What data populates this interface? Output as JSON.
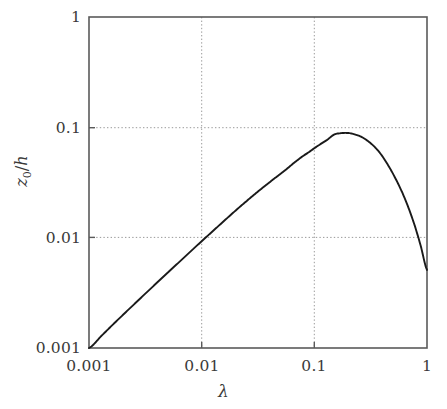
{
  "chart_data": {
    "type": "line",
    "title": "",
    "subtitle": "",
    "xlabel": "λ",
    "ylabel": "z₀/h",
    "ylabel_parts": {
      "main": "z",
      "subscript": "0",
      "slash": "/",
      "denominator": "h"
    },
    "xscale": "log",
    "yscale": "log",
    "xlim": [
      0.001,
      1
    ],
    "ylim": [
      0.001,
      1
    ],
    "grid": true,
    "grid_style": "dotted",
    "grid_color": "#9a9a9a",
    "legend": null,
    "legend_position": "none",
    "axis_color": "#555555",
    "line_color": "#1a1a1a",
    "line_width": 1.9,
    "background_color": "#ffffff",
    "xticks": [
      0.001,
      0.01,
      0.1,
      1
    ],
    "xtick_labels": [
      "0.001",
      "0.01",
      "0.1",
      "1"
    ],
    "yticks": [
      0.001,
      0.01,
      0.1,
      1
    ],
    "ytick_labels": [
      "0.001",
      "0.01",
      "0.1",
      "1"
    ],
    "series": [
      {
        "name": "z0/h vs lambda",
        "x": [
          0.001,
          0.0013,
          0.0017,
          0.0022,
          0.0029,
          0.0038,
          0.005,
          0.0065,
          0.0085,
          0.011,
          0.0145,
          0.019,
          0.025,
          0.032,
          0.042,
          0.055,
          0.072,
          0.09,
          0.11,
          0.13,
          0.15,
          0.17,
          0.19,
          0.21,
          0.24,
          0.27,
          0.31,
          0.35,
          0.4,
          0.46,
          0.52,
          0.6,
          0.68,
          0.78,
          0.88,
          1.0
        ],
        "y": [
          0.001,
          0.0013,
          0.0017,
          0.00219,
          0.00286,
          0.00371,
          0.00482,
          0.00618,
          0.00797,
          0.01015,
          0.0131,
          0.0168,
          0.0214,
          0.0265,
          0.033,
          0.0408,
          0.051,
          0.0598,
          0.069,
          0.077,
          0.086,
          0.0884,
          0.089,
          0.0882,
          0.085,
          0.0805,
          0.073,
          0.065,
          0.055,
          0.044,
          0.035,
          0.026,
          0.019,
          0.0128,
          0.0084,
          0.0051
        ]
      }
    ],
    "annotations": [
      {
        "text": "peak",
        "x": 0.16,
        "y": 0.089
      },
      {
        "text": "curve passes through (0.01, 0.01)",
        "x": 0.01,
        "y": 0.01
      },
      {
        "text": "curve starts at (0.001, 0.001)",
        "x": 0.001,
        "y": 0.001
      },
      {
        "text": "curve ends at (1, 0.005)",
        "x": 1.0,
        "y": 0.005
      }
    ]
  },
  "figure": {
    "plot_area": {
      "left": 89,
      "top": 17,
      "right": 427,
      "bottom": 348
    }
  }
}
